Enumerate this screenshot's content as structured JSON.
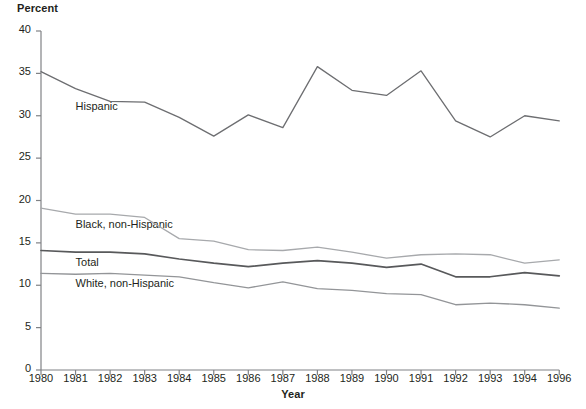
{
  "chart_data": {
    "type": "line",
    "title": "",
    "xlabel": "Year",
    "ylabel": "Percent",
    "ylim": [
      0,
      40
    ],
    "yticks": [
      0,
      5,
      10,
      15,
      20,
      25,
      30,
      35,
      40
    ],
    "grid": false,
    "legend_position": "inline-labels",
    "categories": [
      "1980",
      "1981",
      "1982",
      "1983",
      "1984",
      "1985",
      "1986",
      "1987",
      "1988",
      "1989",
      "1990",
      "1991",
      "1992",
      "1993",
      "1994",
      "1996"
    ],
    "x": [
      1980,
      1981,
      1982,
      1983,
      1984,
      1985,
      1986,
      1987,
      1988,
      1989,
      1990,
      1991,
      1992,
      1993,
      1994,
      1996
    ],
    "series": [
      {
        "name": "Hispanic",
        "color": "#6d6e71",
        "values": [
          35.2,
          33.2,
          31.7,
          31.6,
          29.8,
          27.6,
          30.1,
          28.6,
          35.8,
          33.0,
          32.4,
          35.3,
          29.4,
          27.5,
          30.0,
          29.4
        ]
      },
      {
        "name": "Black, non-Hispanic",
        "color": "#a7a9ac",
        "values": [
          19.1,
          18.4,
          18.4,
          18.0,
          15.5,
          15.2,
          14.2,
          14.1,
          14.5,
          13.9,
          13.2,
          13.6,
          13.7,
          13.6,
          12.6,
          13.0
        ]
      },
      {
        "name": "Total",
        "color": "#58595b",
        "values": [
          14.1,
          13.9,
          13.9,
          13.7,
          13.1,
          12.6,
          12.2,
          12.6,
          12.9,
          12.6,
          12.1,
          12.5,
          11.0,
          11.0,
          11.5,
          11.1
        ]
      },
      {
        "name": "White, non-Hispanic",
        "color": "#939598",
        "values": [
          11.4,
          11.3,
          11.4,
          11.2,
          11.0,
          10.3,
          9.7,
          10.4,
          9.6,
          9.4,
          9.0,
          8.9,
          7.7,
          7.9,
          7.7,
          7.3
        ]
      }
    ],
    "annotations": [
      {
        "text": "Hispanic",
        "x": 1981.0,
        "y": 30.9
      },
      {
        "text": "Black, non-Hispanic",
        "x": 1981.0,
        "y": 17.0
      },
      {
        "text": "Total",
        "x": 1981.0,
        "y": 12.5
      },
      {
        "text": "White, non-Hispanic",
        "x": 1981.0,
        "y": 10.0
      }
    ]
  },
  "axes": {
    "y_title": "Percent",
    "x_title": "Year",
    "y_labels": [
      "40",
      "35",
      "30",
      "25",
      "20",
      "15",
      "10",
      "5",
      "0"
    ],
    "x_labels": [
      "1980",
      "1981",
      "1982",
      "1983",
      "1984",
      "1985",
      "1986",
      "1987",
      "1988",
      "1989",
      "1990",
      "1991",
      "1992",
      "1993",
      "1994",
      "1996"
    ]
  },
  "labels": {
    "hispanic": "Hispanic",
    "black": "Black, non-Hispanic",
    "total": "Total",
    "white": "White, non-Hispanic"
  },
  "colors": {
    "axis": "#808285",
    "hispanic": "#6d6e71",
    "black": "#a7a9ac",
    "total": "#58595b",
    "white": "#939598",
    "text": "#231f20",
    "background": "#ffffff"
  }
}
